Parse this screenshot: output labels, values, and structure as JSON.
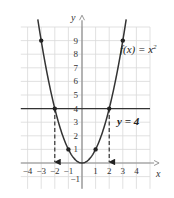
{
  "chart_data": {
    "type": "line",
    "title": "",
    "xlabel": "x",
    "ylabel": "y",
    "xlim": [
      -4.5,
      5
    ],
    "ylim": [
      -1.9,
      10
    ],
    "grid": true,
    "x_ticks": [
      -4,
      -3,
      -2,
      -1,
      1,
      2,
      3,
      4
    ],
    "y_ticks": [
      -1,
      1,
      2,
      3,
      4,
      5,
      6,
      7,
      8,
      9
    ],
    "series": [
      {
        "name": "f(x) = x^2",
        "kind": "curve",
        "function": "x^2",
        "domain": [
          -3.25,
          3.25
        ],
        "marked_points": [
          [
            -3,
            9
          ],
          [
            -2,
            4
          ],
          [
            -1,
            1
          ],
          [
            1,
            1
          ],
          [
            2,
            4
          ],
          [
            3,
            9
          ]
        ]
      },
      {
        "name": "y = 4",
        "kind": "horizontal_line",
        "y": 4
      }
    ],
    "annotations": [
      {
        "text": "f(x) = x²",
        "at": [
          3,
          9
        ]
      },
      {
        "text": "y = 4",
        "at": [
          3.5,
          3.2
        ]
      },
      {
        "type": "dashed_arrow",
        "from": [
          -2,
          4
        ],
        "to": [
          -2,
          0
        ]
      },
      {
        "type": "dashed_arrow",
        "from": [
          2,
          4
        ],
        "to": [
          2,
          0
        ]
      }
    ]
  },
  "labels": {
    "x_axis": "x",
    "y_axis": "y",
    "function_label": "f(x) = x",
    "function_exponent": "2",
    "line_label": "y = 4",
    "x_ticks": [
      "−4",
      "−3",
      "−2",
      "−1",
      "1",
      "2",
      "3",
      "4"
    ],
    "y_ticks": [
      "9",
      "8",
      "7",
      "6",
      "5",
      "4",
      "3",
      "2",
      "1",
      "−1"
    ]
  },
  "colors": {
    "grid": "#d9d9d9",
    "axis": "#8a8a8a",
    "curve": "#333333",
    "line": "#333333",
    "points": "#222222"
  }
}
